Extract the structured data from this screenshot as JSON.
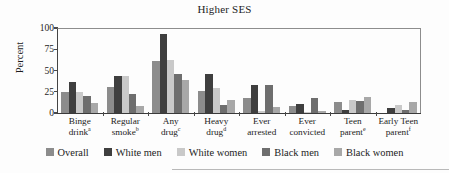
{
  "chart_data": {
    "type": "bar",
    "title": "Higher SES",
    "xlabel": "",
    "ylabel": "Percent",
    "ylim": [
      0,
      100
    ],
    "yticks": [
      0,
      25,
      50,
      75,
      100
    ],
    "grid": false,
    "legend_position": "bottom",
    "categories": [
      "Binge drinkᵃ",
      "Regular smokeᵇ",
      "Any drugᶜ",
      "Heavy drugᵈ",
      "Ever arrested",
      "Ever convicted",
      "Teen parentᵉ",
      "Early Teen parentᶠ"
    ],
    "category_lines": [
      {
        "line1": "Binge",
        "line2": "drink",
        "note": "a"
      },
      {
        "line1": "Regular",
        "line2": "smoke",
        "note": "b"
      },
      {
        "line1": "Any",
        "line2": "drug",
        "note": "c"
      },
      {
        "line1": "Heavy",
        "line2": "drug",
        "note": "d"
      },
      {
        "line1": "Ever",
        "line2": "arrested",
        "note": ""
      },
      {
        "line1": "Ever",
        "line2": "convicted",
        "note": ""
      },
      {
        "line1": "Teen",
        "line2": "parent",
        "note": "e"
      },
      {
        "line1": "Early Teen",
        "line2": "parent",
        "note": "f"
      }
    ],
    "series": [
      {
        "name": "Overall",
        "color": "#8c8c8c",
        "values": [
          25,
          31,
          61,
          26,
          18,
          8,
          13,
          0
        ]
      },
      {
        "name": "White men",
        "color": "#3f3f3f",
        "values": [
          36,
          44,
          93,
          46,
          33,
          11,
          3,
          6
        ]
      },
      {
        "name": "White women",
        "color": "#c9c9c9",
        "values": [
          25,
          43,
          62,
          30,
          2,
          1,
          15,
          10
        ]
      },
      {
        "name": "Black men",
        "color": "#6e6e6e",
        "values": [
          20,
          22,
          46,
          10,
          33,
          18,
          14,
          4
        ]
      },
      {
        "name": "Black women",
        "color": "#a8a8a8",
        "values": [
          12,
          8,
          39,
          15,
          7,
          2,
          19,
          13
        ]
      }
    ]
  }
}
